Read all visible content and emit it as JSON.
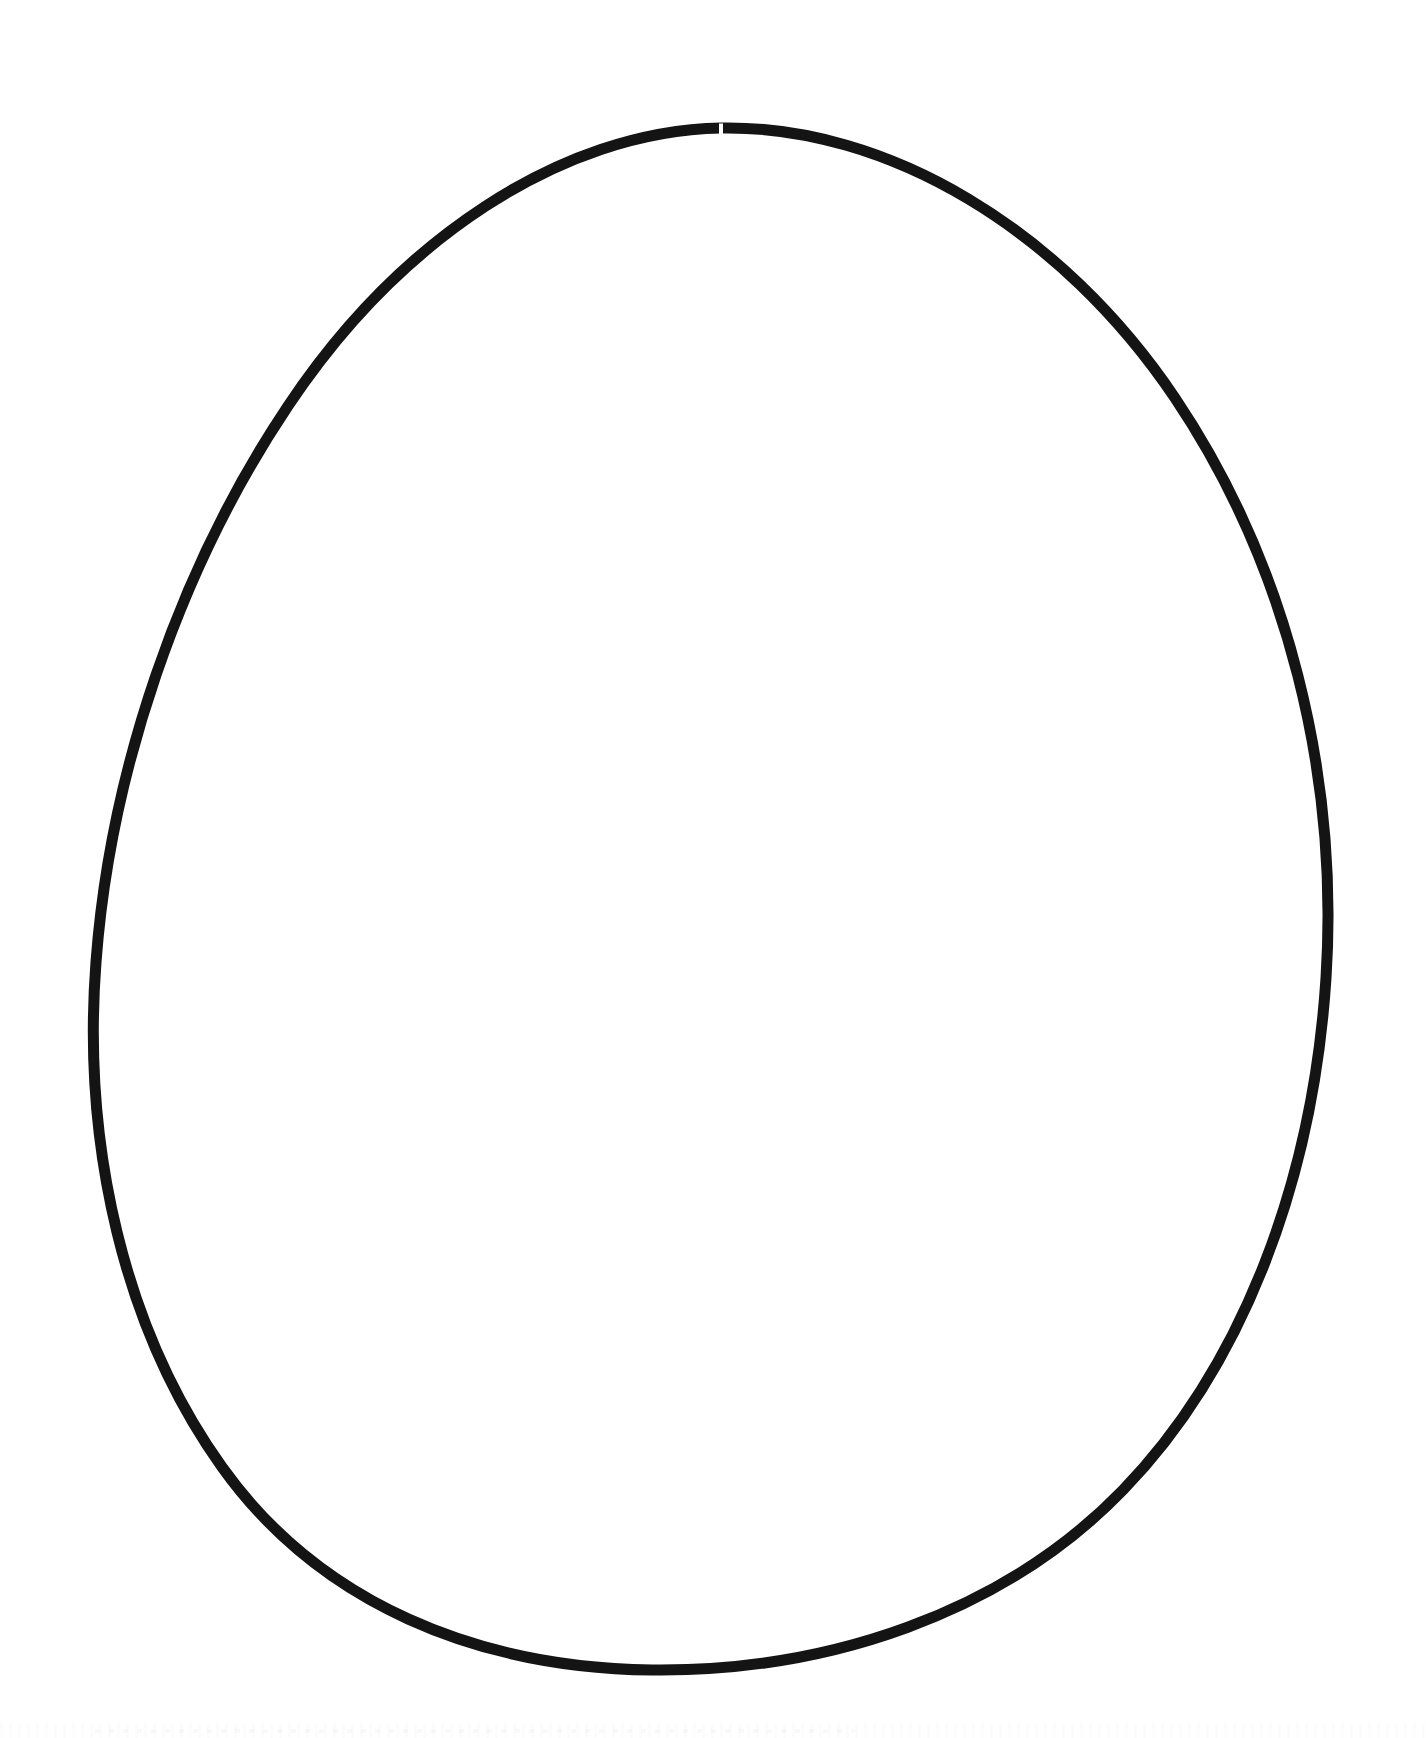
{
  "page": {
    "title": "Egg Outline Template",
    "background_color": "#ffffff",
    "width": 1426,
    "height": 1738,
    "content_type": "line-art",
    "visible_text": ""
  },
  "artwork": {
    "name": "egg-outline",
    "stroke_color": "#141414",
    "fill_color": "none",
    "stroke_width": 11,
    "stroke_linecap": "round",
    "stroke_linejoin": "round",
    "geometry": {
      "top_apex": {
        "x": 720,
        "y": 128
      },
      "bottom_apex": {
        "x": 716,
        "y": 1664
      },
      "leftmost": {
        "x": 93,
        "y": 975
      },
      "rightmost": {
        "x": 1327,
        "y": 948
      },
      "width_px": 1234,
      "height_px": 1536,
      "center_x": 710,
      "widest_at_y": 960,
      "shape": "ovoid, narrow at top, broad and rounded at bottom"
    },
    "seam": {
      "name": "pen-stroke-seam-at-apex",
      "x": 721,
      "y": 130,
      "width": 4,
      "height": 13,
      "note": "small white notch where the two hand-drawn strokes meet at the top"
    },
    "path": "M 721 128 C 560 131, 398 241, 288 406 C 178 570, 110 774, 96 962 C 82 1146, 124 1330, 222 1467 C 320 1604, 478 1668, 652 1670 C 826 1672, 1003 1614, 1123 1490 C 1243 1366, 1313 1180, 1326 978 C 1339 776, 1288 566, 1175 398 C 1062 230, 888 125, 721 128 Z"
  },
  "artifacts": {
    "bottom_scan_noise": {
      "name": "scan-noise-strip",
      "visible": true,
      "opacity": "very faint"
    }
  }
}
